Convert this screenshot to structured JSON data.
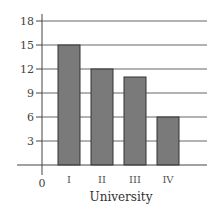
{
  "chart_data": {
    "type": "bar",
    "title": "",
    "xlabel": "University",
    "ylabel": "",
    "categories": [
      "I",
      "II",
      "III",
      "IV"
    ],
    "values": [
      15,
      12,
      11,
      6
    ],
    "ylim": [
      0,
      18
    ],
    "yticks": [
      3,
      6,
      9,
      12,
      15,
      18
    ],
    "ytick_labels": [
      "3",
      "6",
      "9",
      "12",
      "15",
      "18"
    ],
    "origin_label": "0",
    "grid": true,
    "legend": "none",
    "colors": {
      "bar_fill": "#7a7a7a",
      "bar_stroke": "#333333",
      "grid": "#666666",
      "axis": "#444444"
    }
  }
}
